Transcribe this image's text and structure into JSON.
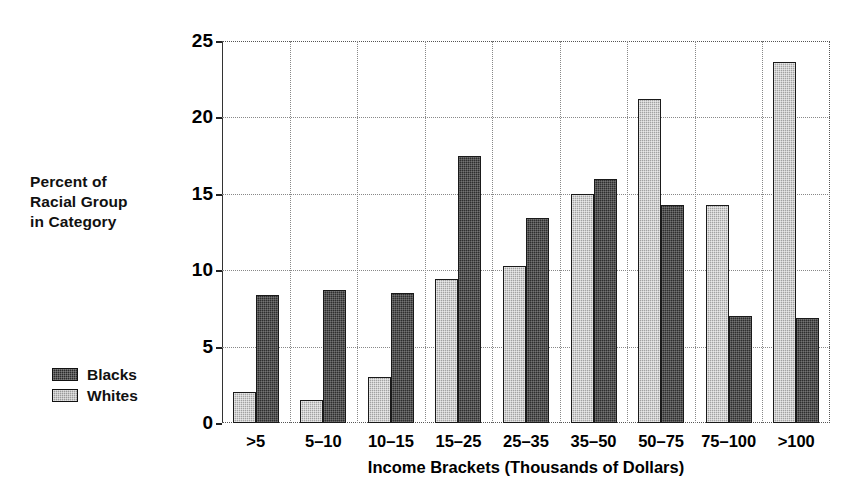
{
  "chart_data": {
    "type": "bar",
    "title": "",
    "xlabel": "Income Brackets (Thousands of Dollars)",
    "ylabel": "Percent of Racial Group in Category",
    "ylabel_lines": [
      "Percent of",
      "Racial Group",
      "in Category"
    ],
    "categories": [
      ">5",
      "5–10",
      "10–15",
      "15–25",
      "25–35",
      "35–50",
      "50–75",
      "75–100",
      ">100"
    ],
    "series": [
      {
        "name": "Whites",
        "key": "whites",
        "style": "light",
        "color": "#a2a2a2",
        "values": [
          2.0,
          1.5,
          3.0,
          9.4,
          10.3,
          15.0,
          21.2,
          14.3,
          23.6
        ]
      },
      {
        "name": "Blacks",
        "key": "blacks",
        "style": "dark",
        "color": "#2e2e2e",
        "values": [
          8.4,
          8.7,
          8.5,
          17.5,
          13.4,
          16.0,
          14.3,
          7.0,
          6.9
        ]
      }
    ],
    "series_draw_order": [
      "whites",
      "blacks"
    ],
    "ylim": [
      0,
      25
    ],
    "yticks": [
      0,
      5,
      10,
      15,
      20,
      25
    ],
    "ytick_labels": [
      "0",
      "5",
      "10",
      "15",
      "20",
      "25"
    ],
    "grid": {
      "horizontal": true,
      "vertical": true,
      "style": "dotted",
      "color": "#888888"
    },
    "legend": {
      "position": "left-outside",
      "entries": [
        {
          "label": "Blacks",
          "style": "dark",
          "color": "#2e2e2e"
        },
        {
          "label": "Whites",
          "style": "light",
          "color": "#a2a2a2"
        }
      ]
    },
    "background_color": "#ffffff",
    "axis_color": "#000000"
  }
}
